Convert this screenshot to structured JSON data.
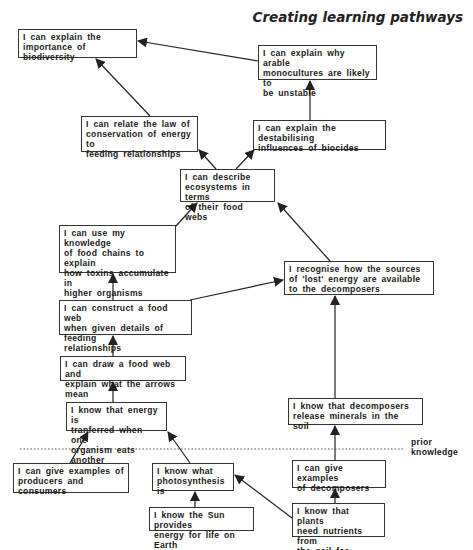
{
  "title": "Creating learning pathways",
  "prior_knowledge_label": "prior\nknowledge",
  "boxes": {
    "biodiversity": "I can explain the\nimportance of biodiversity",
    "monocultures": "I can explain why arable\nmonocultures are likely to\nbe unstable",
    "conservation": "I can relate the law of\nconservation of energy to\nfeeding relationships",
    "biocides": "I can explain the destabilising\ninfluences of biocides",
    "ecosystems": "I can describe\necosystems in terms\nof their food webs",
    "toxins": "I can use my knowledge\nof food chains to explain\nhow toxins accumulate in\nhigher organisms",
    "lost_energy": "I recognise how the sources\nof 'lost' energy are available\nto the decomposers",
    "construct_web": "I can construct a food web\nwhen given details of feeding\nrelationships",
    "draw_web": "I can draw a food web and\nexplain what the arrows mean",
    "energy_transfer": "I know that energy is\ntranferred when one\norganism eats another",
    "decomposers_minerals": "I know that decomposers\nrelease minerals in the soil",
    "producers_consumers": "I can give examples of\nproducers and consumers",
    "photosynthesis": "I know what\nphotosynthesis is",
    "examples_decomposers": "I can give examples\nof decomposers",
    "sun_energy": "I know the Sun provides\nenergy for life on Earth",
    "plant_nutrients": "I know that plants\nneed nutrients from\nthe soil for growth"
  },
  "colors": {
    "line": "#222222",
    "box_border": "#333333",
    "divider": "#555555"
  }
}
